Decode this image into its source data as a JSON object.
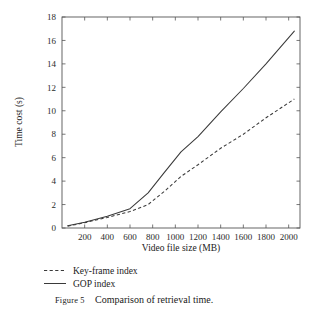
{
  "figure": {
    "caption_prefix": "Figure 5",
    "caption_separator": ":",
    "caption_body": "Comparison of retrieval time.",
    "caption_full": "Figure 5: Comparison of retrieval time."
  },
  "chart_data": {
    "type": "line",
    "title": "",
    "xlabel": "Video file size (MB)",
    "ylabel": "Time cost (s)",
    "xlim": [
      0,
      2100
    ],
    "ylim": [
      0,
      18
    ],
    "xticks": [
      200,
      400,
      600,
      800,
      1000,
      1200,
      1400,
      1600,
      1800,
      2000
    ],
    "yticks": [
      0,
      2,
      4,
      6,
      8,
      10,
      12,
      14,
      16,
      18
    ],
    "xtick_labels": [
      "200",
      "400",
      "600",
      "800",
      "1000",
      "1200",
      "1400",
      "1600",
      "1800",
      "2000"
    ],
    "ytick_labels": [
      "0",
      "2",
      "4",
      "6",
      "8",
      "10",
      "12",
      "14",
      "16",
      "18"
    ],
    "grid": false,
    "legend_position": "below-axes-left",
    "series": [
      {
        "name": "Key-frame index",
        "style": "dashed",
        "color": "#3a3a3a",
        "x": [
          50,
          200,
          400,
          600,
          760,
          900,
          1050,
          1200,
          1400,
          1600,
          1800,
          2050
        ],
        "values": [
          0.15,
          0.45,
          0.9,
          1.4,
          2.0,
          3.1,
          4.4,
          5.4,
          6.8,
          8.0,
          9.4,
          11.0
        ]
      },
      {
        "name": "GOP index",
        "style": "solid",
        "color": "#3a3a3a",
        "x": [
          50,
          200,
          400,
          600,
          760,
          900,
          1050,
          1200,
          1400,
          1600,
          1800,
          2050
        ],
        "values": [
          0.2,
          0.5,
          1.0,
          1.65,
          3.0,
          4.7,
          6.5,
          7.8,
          9.9,
          11.9,
          14.0,
          16.8
        ]
      }
    ]
  },
  "legend": {
    "items": [
      {
        "label": "Key-frame index",
        "style": "dashed"
      },
      {
        "label": "GOP index",
        "style": "solid"
      }
    ]
  }
}
